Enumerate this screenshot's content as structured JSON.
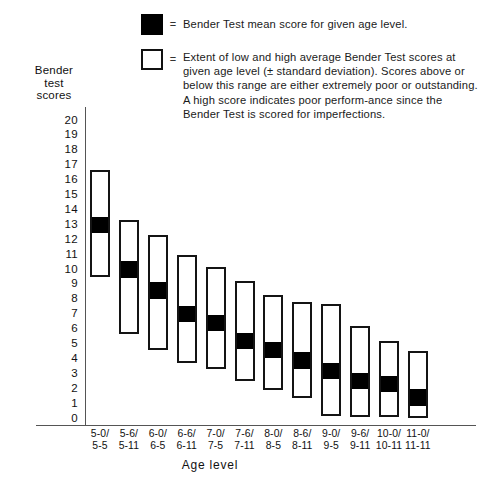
{
  "legend": {
    "items": [
      {
        "swatch": "filled-square",
        "equals": "=",
        "text": "Bender Test mean score for given age level."
      },
      {
        "swatch": "open-square",
        "equals": "=",
        "text": "Extent of low and high average Bender Test scores at given age level (± standard deviation). Scores above or below this range are either extremely poor or outstanding. A high score indicates poor perform-ance since the Bender Test is scored for imperfections."
      }
    ]
  },
  "axis": {
    "y_title_lines": [
      "Bender",
      "test",
      "scores"
    ],
    "x_title": "Age level",
    "y_ticks": [
      "20",
      "19",
      "18",
      "17",
      "16",
      "15",
      "14",
      "13",
      "12",
      "11",
      "10",
      "9",
      "8",
      "7",
      "6",
      "5",
      "4",
      "3",
      "2",
      "1",
      "0"
    ]
  },
  "chart_data": {
    "type": "bar",
    "title": "",
    "subtitle": "",
    "xlabel": "Age level",
    "ylabel": "Bender test scores",
    "ylim": [
      0,
      20
    ],
    "grid": false,
    "legend_position": "top",
    "colors": {
      "mean_fill": "#000000",
      "range_fill": "#ffffff",
      "range_border": "#141414",
      "axis": "#555555"
    },
    "categories": [
      "5-0/5-5",
      "5-6/5-11",
      "6-0/6-5",
      "6-6/6-11",
      "7-0/7-5",
      "7-6/7-11",
      "8-0/8-5",
      "8-6/8-11",
      "9-0/9-5",
      "9-6/9-11",
      "10-0/10-11",
      "11-0/11-11"
    ],
    "category_lines": [
      {
        "lo": "5-0/",
        "hi": "5-5"
      },
      {
        "lo": "5-6/",
        "hi": "5-11"
      },
      {
        "lo": "6-0/",
        "hi": "6-5"
      },
      {
        "lo": "6-6/",
        "hi": "6-11"
      },
      {
        "lo": "7-0/",
        "hi": "7-5"
      },
      {
        "lo": "7-6/",
        "hi": "7-11"
      },
      {
        "lo": "8-0/",
        "hi": "8-5"
      },
      {
        "lo": "8-6/",
        "hi": "8-11"
      },
      {
        "lo": "9-0/",
        "hi": "9-5"
      },
      {
        "lo": "9-6/",
        "hi": "9-11"
      },
      {
        "lo": "10-0/",
        "hi": "10-11"
      },
      {
        "lo": "11-0/",
        "hi": "11-11"
      }
    ],
    "series": [
      {
        "name": "Extent of low and high average Bender Test scores (± 1 SD)",
        "kind": "range",
        "low": [
          9.5,
          5.7,
          4.6,
          3.7,
          3.3,
          2.5,
          1.9,
          1.4,
          0.2,
          0.1,
          0.1,
          0.0
        ],
        "high": [
          16.7,
          13.3,
          12.3,
          11.0,
          10.2,
          9.2,
          8.3,
          7.8,
          7.7,
          6.2,
          5.2,
          4.5
        ]
      },
      {
        "name": "Bender Test mean score for given age level",
        "kind": "mean",
        "values": [
          13.0,
          10.0,
          8.6,
          7.0,
          6.4,
          5.2,
          4.6,
          3.9,
          3.2,
          2.5,
          2.3,
          1.4
        ]
      }
    ]
  }
}
